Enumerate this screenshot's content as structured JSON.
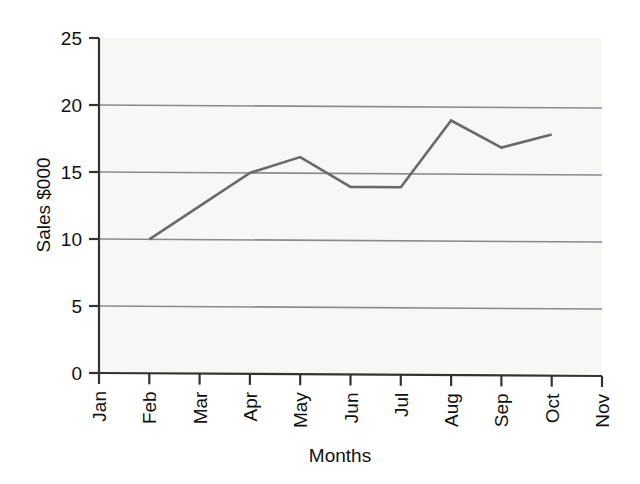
{
  "chart_data": {
    "type": "line",
    "title": "",
    "xlabel": "Months",
    "ylabel": "Sales $000",
    "categories": [
      "Jan",
      "Feb",
      "Mar",
      "Apr",
      "May",
      "Jun",
      "Jul",
      "Aug",
      "Sep",
      "Oct",
      "Nov"
    ],
    "series": [
      {
        "name": "Sales",
        "values": [
          null,
          10,
          12.5,
          15,
          16.2,
          14,
          14,
          19,
          17,
          18,
          null
        ]
      }
    ],
    "ylim": [
      0,
      25
    ],
    "yticks": [
      0,
      5,
      10,
      15,
      20,
      25
    ],
    "ytick_labels": [
      "0",
      "5",
      "10",
      "15",
      "20",
      "25"
    ],
    "xtick_labels": [
      "Jan",
      "Feb",
      "Mar",
      "Apr",
      "May",
      "Jun",
      "Jul",
      "Aug",
      "Sep",
      "Oct",
      "Nov"
    ],
    "grid": "horizontal",
    "legend": "none",
    "xlabel_rotation": -90,
    "colors": {
      "line": "#6a6a6a",
      "gridline": "#8a8a8a",
      "axis": "#333333",
      "plot_background": "#f7f7f5",
      "text": "#111111"
    }
  }
}
